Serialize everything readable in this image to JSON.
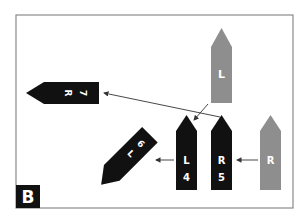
{
  "panel": {
    "label": "B",
    "frame_color": "#8a8a8a"
  },
  "colors": {
    "black": "#111111",
    "gray": "#8e8e8e",
    "text": "#ffffff",
    "line": "#333333"
  },
  "pieces": [
    {
      "id": "gray-L-top",
      "color": "gray",
      "orientation": "up",
      "text": [
        "L"
      ]
    },
    {
      "id": "black-R7",
      "color": "black",
      "orientation": "left",
      "text": [
        "R",
        "7"
      ]
    },
    {
      "id": "black-L4",
      "color": "black",
      "orientation": "up",
      "text": [
        "L",
        "4"
      ]
    },
    {
      "id": "black-R5",
      "color": "black",
      "orientation": "up",
      "text": [
        "R",
        "5"
      ]
    },
    {
      "id": "gray-R-right",
      "color": "gray",
      "orientation": "up",
      "text": [
        "R"
      ]
    },
    {
      "id": "black-L6",
      "color": "black",
      "orientation": "diagonal-up-left",
      "text": [
        "L",
        "6"
      ]
    }
  ],
  "arrows": [
    {
      "from": "gray-L-top",
      "to": "black-L4"
    },
    {
      "from": "black-R5",
      "to": "black-R7"
    },
    {
      "from": "gray-R-right",
      "to": "black-R5"
    },
    {
      "from": "black-L4",
      "to": "black-L6"
    }
  ]
}
